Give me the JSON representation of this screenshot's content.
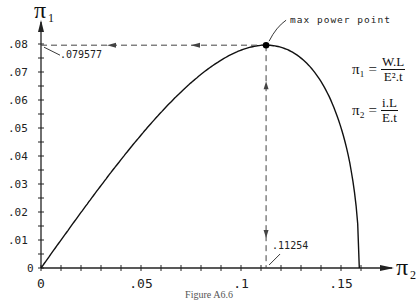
{
  "chart_data": {
    "type": "line",
    "title": "",
    "xlabel": "π2",
    "ylabel": "π1",
    "x_ticks": [
      "0",
      ".05",
      ".1",
      ".15"
    ],
    "y_ticks": [
      "0",
      ".01",
      ".02",
      ".03",
      ".04",
      ".05",
      ".06",
      ".07",
      ".08"
    ],
    "xlim": [
      0,
      0.165
    ],
    "ylim": [
      0,
      0.088
    ],
    "grid": false,
    "series": [
      {
        "name": "π1 vs π2",
        "x": [
          0,
          0.01,
          0.02,
          0.03,
          0.04,
          0.05,
          0.06,
          0.07,
          0.08,
          0.09,
          0.1,
          0.11254,
          0.12,
          0.13,
          0.14,
          0.15,
          0.155,
          0.158,
          0.15915
        ],
        "y": [
          0,
          0.00998,
          0.01984,
          0.02949,
          0.03873,
          0.04749,
          0.05558,
          0.06287,
          0.06917,
          0.07423,
          0.0778,
          0.079577,
          0.07883,
          0.07498,
          0.06658,
          0.05012,
          0.03513,
          0.01897,
          0
        ]
      }
    ],
    "annotations": [
      {
        "text": "max power point",
        "x": 0.11254,
        "y": 0.079577
      },
      {
        "text": ".079577",
        "x": 0,
        "y": 0.079577
      },
      {
        "text": ".11254",
        "x": 0.11254,
        "y": 0
      }
    ]
  },
  "labels": {
    "y_axis": "π",
    "y_axis_sub": "1",
    "x_axis": "π",
    "x_axis_sub": "2",
    "max_point": "max power point",
    "y_value": ".079577",
    "x_value": ".11254",
    "caption": "Figure A6.6"
  },
  "equations": {
    "pi1_lhs": "π₁ =",
    "pi1_num": "W.L",
    "pi1_den": "E².t",
    "pi2_lhs": "π₂ =",
    "pi2_num": "i.L",
    "pi2_den": "E.t"
  },
  "colors": {
    "line": "#111111",
    "axis": "#222222",
    "dash": "#444444"
  }
}
